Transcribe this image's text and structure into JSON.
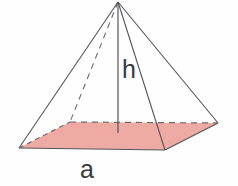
{
  "figure": {
    "background_color": "#fefefe"
  },
  "labels": {
    "height_label": "h",
    "base_edge_label": "a"
  },
  "colors": {
    "base_fill": "#eeaba3",
    "base_fill_speckle": "#e59a92",
    "edge_stroke": "#55555a",
    "hidden_edge_stroke": "#6b6b70",
    "label_color": "#3a3a3a",
    "background": "#fefefe"
  },
  "geometry": {
    "apex": {
      "x": 118,
      "y": 2
    },
    "base_center": {
      "x": 118,
      "y": 133
    },
    "base_vertices": {
      "left": {
        "x": 19,
        "y": 148
      },
      "back": {
        "x": 70,
        "y": 122
      },
      "right": {
        "x": 218,
        "y": 123
      },
      "front": {
        "x": 165,
        "y": 150
      }
    },
    "edges": [
      {
        "name": "lateral-left",
        "from": "apex",
        "to": "left",
        "style": "solid"
      },
      {
        "name": "lateral-front",
        "from": "apex",
        "to": "front",
        "style": "solid"
      },
      {
        "name": "lateral-right",
        "from": "apex",
        "to": "right",
        "style": "solid"
      },
      {
        "name": "lateral-back-hidden",
        "from": "apex",
        "to": "back",
        "style": "dashed"
      },
      {
        "name": "base-front-left",
        "from": "left",
        "to": "front",
        "style": "solid"
      },
      {
        "name": "base-front-right",
        "from": "front",
        "to": "right",
        "style": "solid"
      },
      {
        "name": "base-back-left",
        "from": "left",
        "to": "back",
        "style": "dashed"
      },
      {
        "name": "base-back-right",
        "from": "back",
        "to": "right",
        "style": "dashed"
      },
      {
        "name": "height-line",
        "from": "apex",
        "to": "base_center",
        "style": "solid"
      }
    ]
  },
  "label_positions": {
    "height_label": {
      "x": 122,
      "y": 78
    },
    "base_edge_label": {
      "x": 80,
      "y": 178
    }
  }
}
